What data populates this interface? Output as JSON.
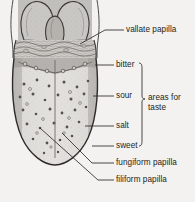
{
  "figure": {
    "background_color": "#f3f2f0",
    "ink_color": "#231f20",
    "tongue_body_color": "#dedcd8",
    "tonsil_color": "#c9c7c4",
    "backdrop_color": "#c4c2bf"
  },
  "labels": {
    "vallate_papilla": "vallate papilla",
    "bitter": "bitter",
    "sour": "sour",
    "salt": "salt",
    "sweet": "sweet",
    "areas_for_taste_line1": "areas for",
    "areas_for_taste_line2": "taste",
    "fungiform_papilla": "fungiform papilla",
    "filiform_papilla": "filiform papilla"
  },
  "structures": [
    {
      "name": "palatine-tonsil-left"
    },
    {
      "name": "palatine-tonsil-right"
    },
    {
      "name": "epiglottis"
    },
    {
      "name": "lingual-tonsil-region"
    },
    {
      "name": "tongue-dorsum"
    },
    {
      "name": "median-sulcus"
    },
    {
      "name": "palatoglossal-arch-left"
    },
    {
      "name": "palatoglossal-arch-right"
    },
    {
      "name": "fungiform-papillae-dots"
    }
  ],
  "taste_zones": [
    {
      "label": "bitter",
      "position": "posterior"
    },
    {
      "label": "sour",
      "position": "lateral-posterior"
    },
    {
      "label": "salt",
      "position": "lateral-anterior"
    },
    {
      "label": "sweet",
      "position": "apex"
    }
  ]
}
